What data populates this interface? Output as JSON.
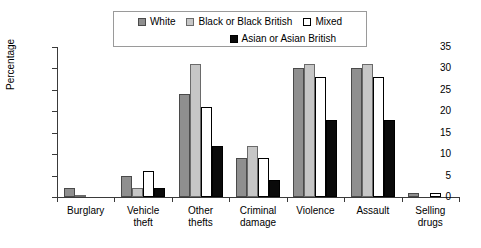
{
  "chart_data": {
    "type": "bar",
    "title": "",
    "subtitle": "",
    "xlabel": "",
    "ylabel": "Percentage",
    "ylim": [
      0,
      35
    ],
    "yticks": [
      0,
      5,
      10,
      15,
      20,
      25,
      30,
      35
    ],
    "grid": false,
    "legend_position": "top",
    "categories": [
      "Burglary",
      "Vehicle theft",
      "Other thefts",
      "Criminal damage",
      "Violence",
      "Assault",
      "Selling drugs"
    ],
    "category_lines": [
      [
        "Burglary"
      ],
      [
        "Vehicle",
        "theft"
      ],
      [
        "Other",
        "thefts"
      ],
      [
        "Criminal",
        "damage"
      ],
      [
        "Violence"
      ],
      [
        "Assault"
      ],
      [
        "Selling",
        "drugs"
      ]
    ],
    "series": [
      {
        "name": "White",
        "color": "#8f8f8f",
        "values": [
          2,
          5,
          24,
          9,
          30,
          30,
          1
        ]
      },
      {
        "name": "Black or Black British",
        "color": "#c6c6c6",
        "values": [
          0.5,
          2,
          31,
          12,
          31,
          31,
          0
        ]
      },
      {
        "name": "Mixed",
        "color": "#ffffff",
        "values": [
          0,
          6,
          21,
          9,
          28,
          28,
          1
        ]
      },
      {
        "name": "Asian or Asian British",
        "color": "#0a0a0a",
        "values": [
          0,
          2,
          12,
          4,
          18,
          18,
          0
        ]
      }
    ]
  },
  "legend": {
    "rows": [
      [
        "White",
        "Black or Black British",
        "Mixed"
      ],
      [
        "Asian or Asian British"
      ]
    ]
  },
  "colors": {
    "white_series": "#8f8f8f",
    "black_series": "#c6c6c6",
    "mixed_series": "#ffffff",
    "asian_series": "#0a0a0a",
    "axis": "#3a3a3a",
    "legend_border": "#9a9a9a"
  }
}
